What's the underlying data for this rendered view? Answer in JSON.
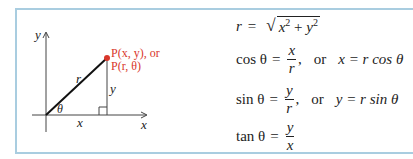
{
  "figure": {
    "axes": {
      "y_label": "y",
      "x_label": "x"
    },
    "triangle": {
      "hyp_label": "r",
      "opp_label": "y",
      "adj_label": "x",
      "angle_label": "θ"
    },
    "point": {
      "label_line1": "P(x, y), or",
      "label_line2": "P(r, θ)",
      "color": "#d9372b"
    },
    "border_color": "#a9cde0"
  },
  "formulas": {
    "r": {
      "lhs": "r",
      "eq": "=",
      "radicand_x": "x",
      "exp": "2",
      "plus": "+",
      "radicand_y": "y"
    },
    "cos": {
      "fn": "cos θ",
      "eq": "=",
      "num": "x",
      "den": "r",
      "comma": ",",
      "or": "or",
      "rhs": "x = r cos θ"
    },
    "sin": {
      "fn": "sin θ",
      "eq": "=",
      "num": "y",
      "den": "r",
      "comma": ",",
      "or": "or",
      "rhs": "y = r sin θ"
    },
    "tan": {
      "fn": "tan θ",
      "eq": "=",
      "num": "y",
      "den": "x"
    }
  }
}
